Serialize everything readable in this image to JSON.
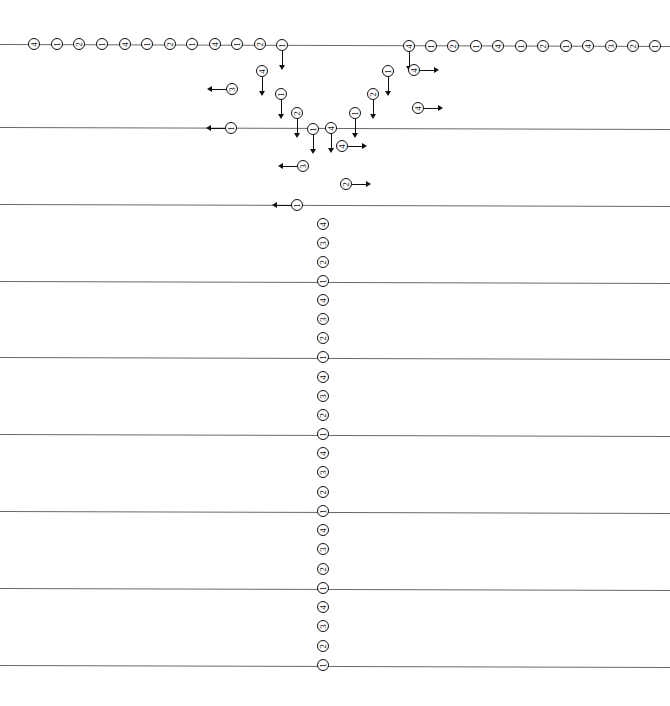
{
  "chart_data": {
    "type": "scatter",
    "title": "",
    "subtitle": "",
    "xlabel": "",
    "ylabel": "",
    "xlim": [
      0,
      670
    ],
    "ylim": [
      0,
      706
    ],
    "grid": true,
    "grid_orientation": "horizontal",
    "legend": null,
    "marker_style": "circle-with-rotated-digit",
    "marker_labels_used": [
      "1",
      "2",
      "3",
      "4"
    ],
    "censoring_arrows": [
      "down",
      "left",
      "right",
      "none"
    ],
    "gridlines": [
      {
        "name": "gridline-1",
        "y": 44,
        "y_right": 46
      },
      {
        "name": "gridline-2",
        "y": 127,
        "y_right": 129
      },
      {
        "name": "gridline-3",
        "y": 204,
        "y_right": 206
      },
      {
        "name": "gridline-4",
        "y": 281,
        "y_right": 283
      },
      {
        "name": "gridline-5",
        "y": 357,
        "y_right": 359
      },
      {
        "name": "gridline-6",
        "y": 434,
        "y_right": 436
      },
      {
        "name": "gridline-7",
        "y": 511,
        "y_right": 513
      },
      {
        "name": "gridline-8",
        "y": 588,
        "y_right": 590
      },
      {
        "name": "gridline-9",
        "y": 665,
        "y_right": 667
      }
    ],
    "points": [
      {
        "x": 34,
        "y": 44,
        "label": "4",
        "arrow": "none"
      },
      {
        "x": 57,
        "y": 44,
        "label": "1",
        "arrow": "none"
      },
      {
        "x": 79,
        "y": 44,
        "label": "2",
        "arrow": "none"
      },
      {
        "x": 102,
        "y": 44,
        "label": "1",
        "arrow": "none"
      },
      {
        "x": 125,
        "y": 44,
        "label": "4",
        "arrow": "none"
      },
      {
        "x": 147,
        "y": 44,
        "label": "1",
        "arrow": "none"
      },
      {
        "x": 170,
        "y": 44,
        "label": "2",
        "arrow": "none"
      },
      {
        "x": 192,
        "y": 44,
        "label": "1",
        "arrow": "none"
      },
      {
        "x": 215,
        "y": 44,
        "label": "4",
        "arrow": "none"
      },
      {
        "x": 237,
        "y": 44,
        "label": "1",
        "arrow": "none"
      },
      {
        "x": 260,
        "y": 44,
        "label": "2",
        "arrow": "none"
      },
      {
        "x": 282,
        "y": 45,
        "label": "1",
        "arrow": "down"
      },
      {
        "x": 262,
        "y": 71,
        "label": "4",
        "arrow": "down"
      },
      {
        "x": 232,
        "y": 89,
        "label": "3",
        "arrow": "left"
      },
      {
        "x": 281,
        "y": 94,
        "label": "1",
        "arrow": "down"
      },
      {
        "x": 297,
        "y": 113,
        "label": "2",
        "arrow": "down"
      },
      {
        "x": 231,
        "y": 128,
        "label": "1",
        "arrow": "left"
      },
      {
        "x": 313,
        "y": 129,
        "label": "1",
        "arrow": "down"
      },
      {
        "x": 331,
        "y": 128,
        "label": "4",
        "arrow": "down"
      },
      {
        "x": 342,
        "y": 146,
        "label": "4",
        "arrow": "right"
      },
      {
        "x": 303,
        "y": 166,
        "label": "3",
        "arrow": "left"
      },
      {
        "x": 346,
        "y": 184,
        "label": "2",
        "arrow": "right"
      },
      {
        "x": 297,
        "y": 205,
        "label": "1",
        "arrow": "left"
      },
      {
        "x": 355,
        "y": 113,
        "label": "1",
        "arrow": "down"
      },
      {
        "x": 373,
        "y": 94,
        "label": "2",
        "arrow": "down"
      },
      {
        "x": 388,
        "y": 71,
        "label": "1",
        "arrow": "down"
      },
      {
        "x": 409,
        "y": 46,
        "label": "4",
        "arrow": "down"
      },
      {
        "x": 414,
        "y": 70,
        "label": "4",
        "arrow": "right"
      },
      {
        "x": 418,
        "y": 108,
        "label": "4",
        "arrow": "right"
      },
      {
        "x": 431,
        "y": 46,
        "label": "1",
        "arrow": "none"
      },
      {
        "x": 453,
        "y": 46,
        "label": "2",
        "arrow": "none"
      },
      {
        "x": 476,
        "y": 46,
        "label": "1",
        "arrow": "none"
      },
      {
        "x": 498,
        "y": 46,
        "label": "4",
        "arrow": "none"
      },
      {
        "x": 521,
        "y": 46,
        "label": "1",
        "arrow": "none"
      },
      {
        "x": 543,
        "y": 46,
        "label": "2",
        "arrow": "none"
      },
      {
        "x": 566,
        "y": 46,
        "label": "1",
        "arrow": "none"
      },
      {
        "x": 588,
        "y": 46,
        "label": "4",
        "arrow": "none"
      },
      {
        "x": 611,
        "y": 46,
        "label": "3",
        "arrow": "none"
      },
      {
        "x": 633,
        "y": 46,
        "label": "2",
        "arrow": "none"
      },
      {
        "x": 655,
        "y": 46,
        "label": "1",
        "arrow": "none"
      },
      {
        "x": 323,
        "y": 224,
        "label": "4",
        "arrow": "none"
      },
      {
        "x": 323,
        "y": 243,
        "label": "3",
        "arrow": "none"
      },
      {
        "x": 323,
        "y": 262,
        "label": "2",
        "arrow": "none"
      },
      {
        "x": 323,
        "y": 281,
        "label": "1",
        "arrow": "none"
      },
      {
        "x": 323,
        "y": 300,
        "label": "4",
        "arrow": "none"
      },
      {
        "x": 323,
        "y": 319,
        "label": "3",
        "arrow": "none"
      },
      {
        "x": 323,
        "y": 338,
        "label": "2",
        "arrow": "none"
      },
      {
        "x": 323,
        "y": 357,
        "label": "1",
        "arrow": "none"
      },
      {
        "x": 323,
        "y": 377,
        "label": "4",
        "arrow": "none"
      },
      {
        "x": 323,
        "y": 396,
        "label": "3",
        "arrow": "none"
      },
      {
        "x": 323,
        "y": 415,
        "label": "2",
        "arrow": "none"
      },
      {
        "x": 323,
        "y": 434,
        "label": "1",
        "arrow": "none"
      },
      {
        "x": 323,
        "y": 453,
        "label": "4",
        "arrow": "none"
      },
      {
        "x": 323,
        "y": 472,
        "label": "3",
        "arrow": "none"
      },
      {
        "x": 323,
        "y": 492,
        "label": "2",
        "arrow": "none"
      },
      {
        "x": 323,
        "y": 511,
        "label": "1",
        "arrow": "none"
      },
      {
        "x": 323,
        "y": 530,
        "label": "4",
        "arrow": "none"
      },
      {
        "x": 323,
        "y": 549,
        "label": "3",
        "arrow": "none"
      },
      {
        "x": 323,
        "y": 569,
        "label": "2",
        "arrow": "none"
      },
      {
        "x": 323,
        "y": 588,
        "label": "1",
        "arrow": "none"
      },
      {
        "x": 323,
        "y": 607,
        "label": "4",
        "arrow": "none"
      },
      {
        "x": 323,
        "y": 626,
        "label": "3",
        "arrow": "none"
      },
      {
        "x": 323,
        "y": 646,
        "label": "2",
        "arrow": "none"
      },
      {
        "x": 323,
        "y": 665,
        "label": "1",
        "arrow": "none"
      }
    ]
  },
  "colors": {
    "background": "#ffffff",
    "gridline": "#6a6a6a",
    "marker_stroke": "#111111",
    "marker_fill": "#ffffff",
    "arrow": "#111111"
  }
}
